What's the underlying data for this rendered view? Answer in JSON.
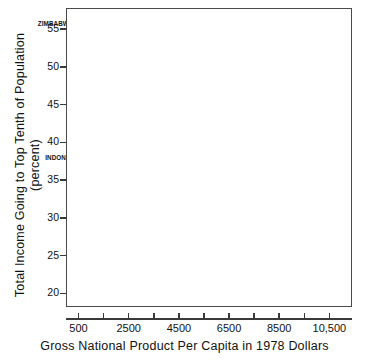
{
  "chart_data": {
    "type": "scatter",
    "title": "",
    "xlabel": "Gross National Product Per Capita in 1978 Dollars",
    "ylabel_line1": "Total Income Going to Top Tenth of Population",
    "ylabel_line2": "(percent)",
    "xlim": [
      0,
      11400
    ],
    "ylim": [
      18.2,
      57.8
    ],
    "grid": false,
    "legend": "none",
    "xticks": [
      500,
      2500,
      4500,
      6500,
      8500,
      10500
    ],
    "xtick_labels": [
      "500",
      "2500",
      "4500",
      "6500",
      "8500",
      "10,500"
    ],
    "xminor_ticks": [
      1500,
      3500,
      5500,
      7500,
      9500
    ],
    "yticks": [
      20,
      25,
      30,
      35,
      40,
      45,
      50,
      55
    ],
    "ytick_labels": [
      "20",
      "25",
      "30",
      "35",
      "40",
      "45",
      "50",
      "55"
    ],
    "points": [
      {
        "label": "ECUADOR",
        "x": 880,
        "y": 56.5,
        "lx": 5,
        "ly": -3,
        "anchor": "left"
      },
      {
        "label": "",
        "x": 600,
        "y": 56.5,
        "lx": 0,
        "ly": 0,
        "anchor": "none"
      },
      {
        "label": "ZIMBABWE",
        "x": 480,
        "y": 55.3,
        "lx": -5,
        "ly": -3,
        "anchor": "right"
      },
      {
        "label": "KENYA",
        "x": 320,
        "y": 54.0,
        "lx": 5,
        "ly": -3,
        "anchor": "left"
      },
      {
        "label": "GABON",
        "x": 4150,
        "y": 54.0,
        "lx": -5,
        "ly": -3,
        "anchor": "right"
      },
      {
        "label": "",
        "x": 460,
        "y": 49.8,
        "lx": 0,
        "ly": 0,
        "anchor": "none"
      },
      {
        "label": "BRAZIL",
        "x": 1560,
        "y": 49.6,
        "lx": 0,
        "ly": -8,
        "anchor": "center"
      },
      {
        "label": "IRAQ",
        "x": 1900,
        "y": 48.2,
        "lx": 5,
        "ly": -2,
        "anchor": "left"
      },
      {
        "label": "MADAGASCAR",
        "x": 250,
        "y": 47.0,
        "lx": 5,
        "ly": -2,
        "anchor": "left"
      },
      {
        "label": "SENEGAL",
        "x": 250,
        "y": 45.8,
        "lx": 5,
        "ly": -2,
        "anchor": "left"
      },
      {
        "label": "SIERRA LEONE",
        "x": 200,
        "y": 44.8,
        "lx": 5,
        "ly": -2,
        "anchor": "left"
      },
      {
        "label": "",
        "x": 820,
        "y": 43.6,
        "lx": 0,
        "ly": 0,
        "anchor": "none"
      },
      {
        "label": "",
        "x": 500,
        "y": 42.5,
        "lx": 0,
        "ly": 0,
        "anchor": "none"
      },
      {
        "label": "COLUMBIA",
        "x": 810,
        "y": 42.5,
        "lx": 5,
        "ly": -2,
        "anchor": "left"
      },
      {
        "label": "LEBANON",
        "x": 1030,
        "y": 41.6,
        "lx": 5,
        "ly": -2,
        "anchor": "left"
      },
      {
        "label": "IVORY COAST",
        "x": 700,
        "y": 40.7,
        "lx": 5,
        "ly": -2,
        "anchor": "left"
      },
      {
        "label": "",
        "x": 620,
        "y": 40.7,
        "lx": 0,
        "ly": 0,
        "anchor": "none"
      },
      {
        "label": "TURKEY",
        "x": 800,
        "y": 39.5,
        "lx": 5,
        "ly": -2,
        "anchor": "left"
      },
      {
        "label": "",
        "x": 250,
        "y": 39.5,
        "lx": 0,
        "ly": 0,
        "anchor": "none"
      },
      {
        "label": "S. AFRICA",
        "x": 1350,
        "y": 38.7,
        "lx": 5,
        "ly": -2,
        "anchor": "left"
      },
      {
        "label": "",
        "x": 400,
        "y": 38.4,
        "lx": 0,
        "ly": 0,
        "anchor": "none"
      },
      {
        "label": "INDON.",
        "x": 200,
        "y": 37.7,
        "lx": -3,
        "ly": -2,
        "anchor": "right"
      },
      {
        "label": "COSTA RICA",
        "x": 1480,
        "y": 37.7,
        "lx": 5,
        "ly": -2,
        "anchor": "left"
      },
      {
        "label": "",
        "x": 1320,
        "y": 37.7,
        "lx": 0,
        "ly": 0,
        "anchor": "none"
      },
      {
        "label": "",
        "x": 700,
        "y": 37.7,
        "lx": 0,
        "ly": 0,
        "anchor": "none"
      },
      {
        "label": "",
        "x": 280,
        "y": 36.6,
        "lx": 0,
        "ly": 0,
        "anchor": "none"
      },
      {
        "label": "TUNISIA",
        "x": 1010,
        "y": 35.6,
        "lx": 5,
        "ly": -2,
        "anchor": "left"
      },
      {
        "label": "",
        "x": 890,
        "y": 35.6,
        "lx": 0,
        "ly": 0,
        "anchor": "none"
      },
      {
        "label": "MEXICO",
        "x": 1240,
        "y": 34.4,
        "lx": 5,
        "ly": -2,
        "anchor": "left"
      },
      {
        "label": "",
        "x": 640,
        "y": 34.4,
        "lx": 0,
        "ly": 0,
        "anchor": "none"
      },
      {
        "label": "ARGENTINA",
        "x": 1760,
        "y": 33.4,
        "lx": -5,
        "ly": -2,
        "anchor": "right"
      },
      {
        "label": "INDIA",
        "x": 210,
        "y": 33.0,
        "lx": 5,
        "ly": -2,
        "anchor": "left"
      },
      {
        "label": "VENEZUELA",
        "x": 2600,
        "y": 33.0,
        "lx": 5,
        "ly": -2,
        "anchor": "left"
      },
      {
        "label": "CHILE",
        "x": 1280,
        "y": 32.1,
        "lx": 5,
        "ly": -2,
        "anchor": "left"
      },
      {
        "label": "",
        "x": 2070,
        "y": 32.1,
        "lx": 0,
        "ly": 0,
        "anchor": "none"
      },
      {
        "label": "HONG KONG",
        "x": 3100,
        "y": 30.8,
        "lx": 0,
        "ly": 6,
        "anchor": "center"
      },
      {
        "label": "",
        "x": 420,
        "y": 30.7,
        "lx": 0,
        "ly": 0,
        "anchor": "none"
      },
      {
        "label": "",
        "x": 700,
        "y": 30.7,
        "lx": 0,
        "ly": 0,
        "anchor": "none"
      },
      {
        "label": "",
        "x": 1120,
        "y": 29.8,
        "lx": 0,
        "ly": 0,
        "anchor": "none"
      },
      {
        "label": "ITALY",
        "x": 4850,
        "y": 30.8,
        "lx": 5,
        "ly": -2,
        "anchor": "left"
      },
      {
        "label": "FINLAND",
        "x": 6900,
        "y": 31.6,
        "lx": 0,
        "ly": -8,
        "anchor": "center"
      },
      {
        "label": "FRANCE",
        "x": 9300,
        "y": 30.2,
        "lx": 0,
        "ly": -8,
        "anchor": "center"
      },
      {
        "label": "EGYPT",
        "x": 340,
        "y": 28.3,
        "lx": 5,
        "ly": -2,
        "anchor": "left"
      },
      {
        "label": "",
        "x": 250,
        "y": 28.3,
        "lx": 0,
        "ly": 0,
        "anchor": "none"
      },
      {
        "label": "",
        "x": 180,
        "y": 28.3,
        "lx": 0,
        "ly": 0,
        "anchor": "none"
      },
      {
        "label": "URUGUAY",
        "x": 1730,
        "y": 28.2,
        "lx": 5,
        "ly": -2,
        "anchor": "left"
      },
      {
        "label": "W. GERMANY",
        "x": 10400,
        "y": 29.4,
        "lx": -5,
        "ly": 5,
        "anchor": "right"
      },
      {
        "label": "GREECE",
        "x": 4250,
        "y": 27.1,
        "lx": 5,
        "ly": -2,
        "anchor": "left"
      },
      {
        "label": "NETHER.",
        "x": 9950,
        "y": 27.5,
        "lx": 5,
        "ly": -2,
        "anchor": "left"
      },
      {
        "label": "JAPAN",
        "x": 7700,
        "y": 26.6,
        "lx": 0,
        "ly": -8,
        "anchor": "center"
      },
      {
        "label": "",
        "x": 460,
        "y": 26.5,
        "lx": 0,
        "ly": 0,
        "anchor": "none"
      },
      {
        "label": "ISRAEL",
        "x": 4400,
        "y": 26.1,
        "lx": 5,
        "ly": -2,
        "anchor": "left"
      },
      {
        "label": "S. KOREA",
        "x": 980,
        "y": 26.1,
        "lx": 5,
        "ly": -2,
        "anchor": "left"
      },
      {
        "label": "U.S.A.",
        "x": 10350,
        "y": 26.3,
        "lx": 5,
        "ly": -2,
        "anchor": "left"
      },
      {
        "label": "PAKISTAN",
        "x": 160,
        "y": 25.5,
        "lx": 5,
        "ly": -2,
        "anchor": "left"
      },
      {
        "label": "SPAIN",
        "x": 4550,
        "y": 25.2,
        "lx": 5,
        "ly": -2,
        "anchor": "left"
      },
      {
        "label": "NEW ZEALAND",
        "x": 6050,
        "y": 24.6,
        "lx": 0,
        "ly": -8,
        "anchor": "center"
      },
      {
        "label": "CANADA",
        "x": 8800,
        "y": 24.7,
        "lx": 0,
        "ly": -8,
        "anchor": "center"
      },
      {
        "label": "BANGLADESH",
        "x": 150,
        "y": 24.8,
        "lx": 5,
        "ly": -2,
        "anchor": "left"
      },
      {
        "label": "DENMARK",
        "x": 10400,
        "y": 25.1,
        "lx": -5,
        "ly": 5,
        "anchor": "right"
      },
      {
        "label": "TAIWAN",
        "x": 600,
        "y": 23.7,
        "lx": 5,
        "ly": -2,
        "anchor": "left"
      },
      {
        "label": "YUGOSLAVIA",
        "x": 1800,
        "y": 22.8,
        "lx": 5,
        "ly": -2,
        "anchor": "left"
      },
      {
        "label": "UNITED",
        "x": 6050,
        "y": 23.1,
        "lx": 0,
        "ly": 6,
        "anchor": "center"
      },
      {
        "label": "KINGDOM",
        "x": 6050,
        "y": 22.1,
        "lx": 0,
        "ly": 6,
        "anchor": "center"
      },
      {
        "label": "AUSTRALIA",
        "x": 8500,
        "y": 23.2,
        "lx": 0,
        "ly": 6,
        "anchor": "center"
      },
      {
        "label": "POLAND",
        "x": 4500,
        "y": 22.0,
        "lx": 5,
        "ly": -2,
        "anchor": "left"
      },
      {
        "label": "NORWAY",
        "x": 10050,
        "y": 22.2,
        "lx": 5,
        "ly": -2,
        "anchor": "left"
      },
      {
        "label": "LIBYA",
        "x": 7000,
        "y": 21.8,
        "lx": 0,
        "ly": 6,
        "anchor": "center"
      },
      {
        "label": "SWEDEN",
        "x": 10700,
        "y": 21.1,
        "lx": 0,
        "ly": 6,
        "anchor": "center"
      },
      {
        "label": "BULGARIA",
        "x": 3250,
        "y": 19.9,
        "lx": 0,
        "ly": -7,
        "anchor": "center"
      },
      {
        "label": "HUNGARY",
        "x": 3620,
        "y": 19.9,
        "lx": 5,
        "ly": -2,
        "anchor": "left"
      },
      {
        "label": "CZECHOSLOVAKIA",
        "x": 5000,
        "y": 19.1,
        "lx": 5,
        "ly": -2,
        "anchor": "left"
      },
      {
        "label": "E. GERMANY",
        "x": 5800,
        "y": 18.5,
        "lx": 5,
        "ly": -2,
        "anchor": "left"
      }
    ]
  },
  "axes": {
    "x_title": "Gross National Product Per Capita in 1978 Dollars",
    "y_title_line1": "Total Income Going to Top Tenth of Population",
    "y_title_line2": "(percent)"
  }
}
